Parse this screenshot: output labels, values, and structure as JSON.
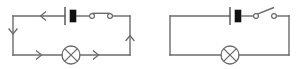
{
  "figure": {
    "background_color": "#ffffff",
    "line_color": "#6b6b6b",
    "cell_fill_color": "#111111",
    "width": 303,
    "height": 69
  },
  "circuits": [
    {
      "id": "left",
      "name": "closed-circuit",
      "switch_state": "closed",
      "current_flowing": true,
      "current_direction": "counter-clockwise",
      "frame": {
        "x1": 13,
        "y1": 16,
        "x2": 130,
        "y2": 55
      },
      "battery": {
        "name": "cell",
        "center_x": 68,
        "long_plate_half_height": 9,
        "short_plate_width": 6,
        "short_plate_half_height": 6,
        "gap": 5
      },
      "switch": {
        "name": "closed-switch",
        "terminal_left_x": 92,
        "terminal_right_x": 110,
        "terminal_radius": 2.4,
        "blade_tilt_degrees": 0
      },
      "lamp": {
        "name": "lamp",
        "center_x": 71,
        "center_y": 55,
        "radius": 9
      },
      "arrows": [
        {
          "name": "arrow-top",
          "x": 42,
          "y": 16,
          "direction": "left"
        },
        {
          "name": "arrow-left",
          "x": 13,
          "y": 33,
          "direction": "down"
        },
        {
          "name": "arrow-bottom-left",
          "x": 40,
          "y": 55,
          "direction": "right"
        },
        {
          "name": "arrow-bottom-right",
          "x": 97,
          "y": 55,
          "direction": "right"
        },
        {
          "name": "arrow-right",
          "x": 130,
          "y": 36,
          "direction": "up"
        }
      ]
    },
    {
      "id": "right",
      "name": "open-circuit",
      "switch_state": "open",
      "current_flowing": false,
      "current_direction": "none",
      "frame": {
        "x1": 170,
        "y1": 16,
        "x2": 289,
        "y2": 55
      },
      "battery": {
        "name": "cell",
        "center_x": 233,
        "long_plate_half_height": 9,
        "short_plate_width": 6,
        "short_plate_half_height": 6,
        "gap": 5
      },
      "switch": {
        "name": "open-switch",
        "terminal_left_x": 256,
        "terminal_right_x": 274,
        "terminal_radius": 2.4,
        "blade_tilt_degrees": -32
      },
      "lamp": {
        "name": "lamp",
        "center_x": 230,
        "center_y": 55,
        "radius": 9
      },
      "arrows": []
    }
  ],
  "legend": {
    "symbols": [
      {
        "name": "cell-symbol",
        "label": "Cell / battery"
      },
      {
        "name": "switch-symbol",
        "label": "Switch"
      },
      {
        "name": "lamp-symbol",
        "label": "Lamp"
      },
      {
        "name": "arrow-symbol",
        "label": "Conventional current direction"
      }
    ]
  }
}
